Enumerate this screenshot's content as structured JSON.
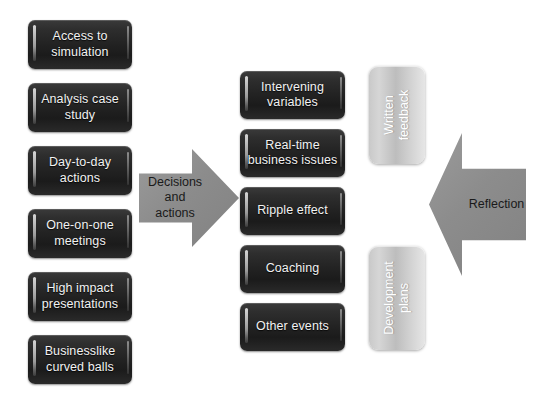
{
  "diagram": {
    "background_color": "#ffffff",
    "dark_box_color": "#222222",
    "silver_box_color": "#cccccc",
    "arrow_color": "#8c8c8c"
  },
  "left_column": {
    "items": [
      {
        "label": "Access to\nsimulation"
      },
      {
        "label": "Analysis case\nstudy"
      },
      {
        "label": "Day-to-day\nactions"
      },
      {
        "label": "One-on-one\nmeetings"
      },
      {
        "label": "High impact\npresentations"
      },
      {
        "label": "Businesslike\ncurved balls"
      }
    ]
  },
  "middle_column": {
    "items": [
      {
        "label": "Intervening\nvariables"
      },
      {
        "label": "Real-time\nbusiness issues"
      },
      {
        "label": "Ripple effect"
      },
      {
        "label": "Coaching"
      },
      {
        "label": "Other events"
      }
    ]
  },
  "right_column": {
    "items": [
      {
        "label": "Written\nfeedback"
      },
      {
        "label": "Development\nplans"
      }
    ]
  },
  "arrows": {
    "forward": {
      "label": "Decisions\nand\nactions",
      "direction": "right"
    },
    "back": {
      "label": "Reflection",
      "direction": "left"
    }
  }
}
